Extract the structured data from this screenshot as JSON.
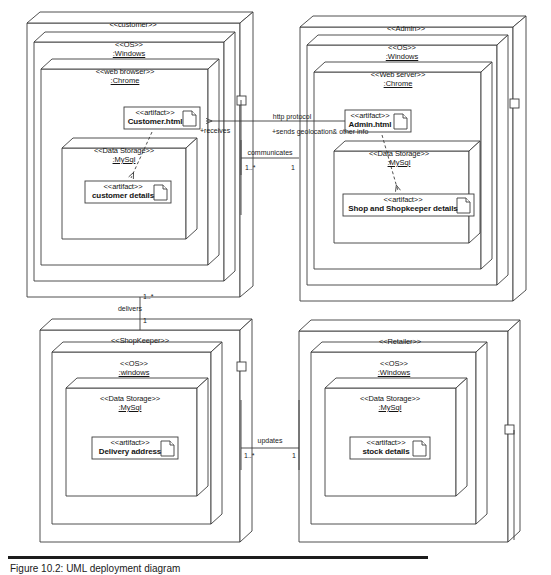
{
  "diagram": {
    "title": "UML Deployment Diagram",
    "caption": "Figure 10.2: UML deployment diagram",
    "stroke_color": "#3c3c3c",
    "fill_color": "#ffffff"
  },
  "nodes": {
    "customer": {
      "stereotype": "<<customer>>",
      "os": {
        "stereotype": "<<OS>>",
        "instance": ":Windows"
      },
      "browser": {
        "stereotype": "<<web browser>>",
        "instance": ":Chrome"
      },
      "artifact_top": {
        "stereotype": "<<artifact>>",
        "name": "Customer.html"
      },
      "storage": {
        "stereotype": "<<Data Storage>>",
        "instance": ":MySql"
      },
      "artifact_db": {
        "stereotype": "<<artifact>>",
        "name": "customer details"
      }
    },
    "admin": {
      "stereotype": "<<Admin>>",
      "os": {
        "stereotype": "<<OS>>",
        "instance": ":Windows"
      },
      "server": {
        "stereotype": "<<Web server>>",
        "instance": ":Chrome"
      },
      "artifact_top": {
        "stereotype": "<<artifact>>",
        "name": "Admin.html"
      },
      "storage": {
        "stereotype": "<<Data Storage>>",
        "instance": ":MySql"
      },
      "artifact_db": {
        "stereotype": "<<artifact>>",
        "name": "Shop and Shopkeeper details"
      }
    },
    "shopkeeper": {
      "stereotype": "<<ShopKeeper>>",
      "os": {
        "stereotype": "<<OS>>",
        "instance": ":windows"
      },
      "storage": {
        "stereotype": "<<Data Storage>>",
        "instance": ":MySql"
      },
      "artifact_db": {
        "stereotype": "<<artifact>>",
        "name": "Delivery address"
      }
    },
    "retailer": {
      "stereotype": "<<Retailer>>",
      "os": {
        "stereotype": "<<OS>>",
        "instance": ":Windows"
      },
      "storage": {
        "stereotype": "<<Data Storage>>",
        "instance": ":MySql"
      },
      "artifact_db": {
        "stereotype": "<<artifact>>",
        "name": "stock details"
      }
    }
  },
  "connections": {
    "http": {
      "label": "http protocol"
    },
    "sends": {
      "label": "+sends geolocation& other info"
    },
    "receives": {
      "label": "+receives"
    },
    "communicates": {
      "label": "communicates",
      "mult_left": "1..*",
      "mult_right": "1"
    },
    "delivers": {
      "label": "delivers",
      "mult_top": "1..*",
      "mult_bottom": "1"
    },
    "updates": {
      "label": "updates",
      "mult_left": "1..*",
      "mult_right": "1"
    }
  }
}
